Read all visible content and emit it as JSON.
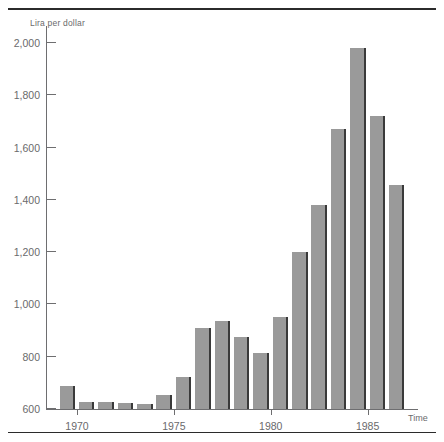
{
  "chart_data": {
    "type": "bar",
    "title": "",
    "subtitle": "",
    "xlabel": "Time",
    "ylabel": "Lira per dollar",
    "ylim": [
      600,
      2080
    ],
    "ytick_values": [
      600,
      800,
      1000,
      1200,
      1400,
      1600,
      1800,
      2000
    ],
    "ytick_labels": [
      "600",
      "800",
      "1,000",
      "1,200",
      "1,400",
      "1,600",
      "1,800",
      "2,000"
    ],
    "xtick_values": [
      1970,
      1975,
      1980,
      1985
    ],
    "xtick_labels": [
      "1970",
      "1975",
      "1980",
      "1985"
    ],
    "xlim": [
      1968.4,
      1987.6
    ],
    "grid": false,
    "legend": null,
    "baseline": 600,
    "bar_color": "#9a9a9a",
    "bar_edge_color": "#3a3a3a",
    "axis_color": "#6e6e70",
    "text_color": "#6a6a6c",
    "rule_color": "#2b2b2b",
    "categories": [
      1969,
      1970,
      1971,
      1972,
      1973,
      1974,
      1975,
      1976,
      1977,
      1978,
      1979,
      1980,
      1981,
      1982,
      1983,
      1984,
      1985,
      1986
    ],
    "values": [
      688,
      627,
      628,
      624,
      620,
      655,
      724,
      910,
      935,
      876,
      813,
      950,
      1200,
      1380,
      1670,
      1980,
      1720,
      1455
    ],
    "series": [
      {
        "name": "Lira per dollar",
        "values": [
          688,
          627,
          628,
          624,
          620,
          655,
          724,
          910,
          935,
          876,
          813,
          950,
          1200,
          1380,
          1670,
          1980,
          1720,
          1455
        ]
      }
    ]
  }
}
